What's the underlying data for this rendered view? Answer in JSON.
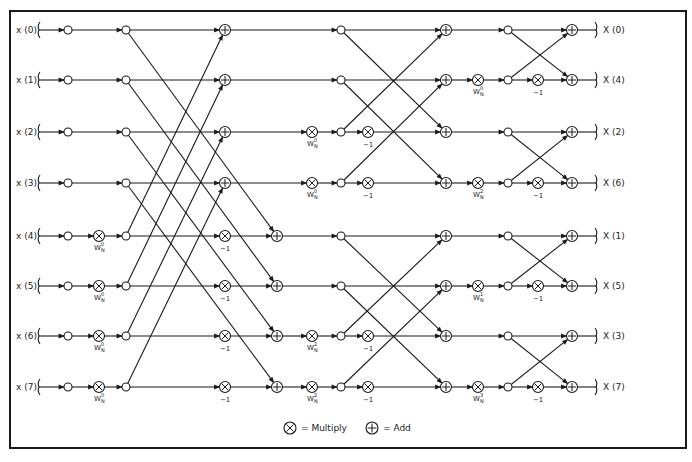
{
  "colors": {
    "ink": "#1a1a1a",
    "background": "#ffffff"
  },
  "rows_y": [
    30,
    80,
    132,
    183,
    236,
    286,
    336,
    387
  ],
  "inputs": [
    "x (0)",
    "x (1)",
    "x (2)",
    "x (3)",
    "x (4)",
    "x (5)",
    "x (6)",
    "x (7)"
  ],
  "outputs": [
    "X (0)",
    "X (4)",
    "X (2)",
    "X (6)",
    "X (1)",
    "X (5)",
    "X (3)",
    "X (7)"
  ],
  "stage1": {
    "input_twiddle": [
      "",
      "",
      "",
      "",
      "W_N^0",
      "W_N^0",
      "W_N^0",
      "W_N^0"
    ],
    "minus_one_rows": [
      4,
      5,
      6,
      7
    ]
  },
  "stage2": {
    "twiddles": [
      "",
      "",
      "W_N^0",
      "W_N^0",
      "",
      "",
      "W_N^2",
      "W_N^2"
    ],
    "minus_one_rows": [
      2,
      3,
      6,
      7
    ]
  },
  "stage3": {
    "twiddles": [
      "",
      "W_N^0",
      "",
      "W_N^2",
      "",
      "W_N^1",
      "",
      "W_N^3"
    ],
    "minus_one_rows": [
      1,
      3,
      5,
      7
    ]
  },
  "minus_one_label": "−1",
  "legend": {
    "multiply_label": "= Multiply",
    "add_label": "= Add",
    "multiply_icon": "circled-times-icon",
    "add_icon": "circled-plus-icon"
  }
}
